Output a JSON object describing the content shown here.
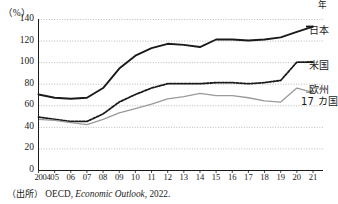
{
  "figure": {
    "unit_label": "（%）",
    "x_axis_unit": "年",
    "source_prefix": "（出所）",
    "source_body": "OECD, ",
    "source_italic": "Economic Outlook",
    "source_suffix": ", 2022."
  },
  "colors": {
    "japan": "#1a1a1a",
    "usa": "#1a1a1a",
    "europe": "#9a9a9a",
    "gridline": "#9a9a9a",
    "axis": "#1a1a1a",
    "background": "#ffffff"
  },
  "chart_data": {
    "type": "line",
    "title": "",
    "subtitle": "",
    "xlabel": "年",
    "ylabel": "（%）",
    "xlim": [
      2004,
      2021
    ],
    "ylim": [
      0,
      140
    ],
    "yticks": [
      0,
      20,
      40,
      60,
      80,
      100,
      120,
      140
    ],
    "ytick_labels": [
      "0",
      "20",
      "40",
      "60",
      "80",
      "100",
      "120",
      "140"
    ],
    "grid": true,
    "grid_axis": "y",
    "grid_style": "dotted",
    "legend_position": "right-end-of-line",
    "x": [
      2004,
      2005,
      2006,
      2007,
      2008,
      2009,
      2010,
      2011,
      2012,
      2013,
      2014,
      2015,
      2016,
      2017,
      2018,
      2019,
      2020,
      2021
    ],
    "xtick_labels": [
      "2004",
      "05",
      "06",
      "07",
      "08",
      "09",
      "10",
      "11",
      "12",
      "13",
      "14",
      "15",
      "16",
      "17",
      "18",
      "19",
      "20",
      "21"
    ],
    "series": [
      {
        "name": "日本",
        "label": "日本",
        "style": "solid",
        "color": "#1a1a1a",
        "width": 1.9,
        "values": [
          70,
          67,
          66,
          67,
          76,
          94,
          106,
          113,
          117,
          116,
          114,
          121,
          121,
          120,
          121,
          123,
          128,
          133
        ]
      },
      {
        "name": "米国",
        "label": "米国",
        "style": "dashed",
        "color": "#1a1a1a",
        "width": 1.8,
        "values": [
          49,
          47,
          45,
          45,
          52,
          63,
          70,
          76,
          80,
          80,
          80,
          81,
          81,
          80,
          81,
          83,
          100,
          100
        ]
      },
      {
        "name": "欧州17カ国",
        "label": "欧州",
        "label_line2": "17 カ国",
        "style": "solid",
        "color": "#9a9a9a",
        "width": 1.3,
        "values": [
          47,
          46,
          44,
          42,
          47,
          53,
          57,
          61,
          66,
          68,
          71,
          69,
          69,
          67,
          64,
          63,
          76,
          72
        ]
      }
    ]
  }
}
